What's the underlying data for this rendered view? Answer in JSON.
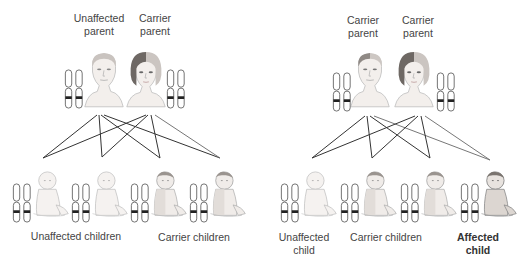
{
  "diagram": {
    "type": "autosomal recessive inheritance",
    "colors": {
      "line": "#333333",
      "outline": "#555555",
      "band": "#222222",
      "face": "#f1ece8",
      "shade": "#8a8a8a"
    }
  },
  "left_panel": {
    "parents": [
      {
        "label_line1": "Unaffected",
        "label_line2": "parent",
        "status": "unaffected"
      },
      {
        "label_line1": "Carrier",
        "label_line2": "parent",
        "status": "carrier"
      }
    ],
    "children_labels": [
      {
        "text": "Unaffected children"
      },
      {
        "text": "Carrier children"
      }
    ]
  },
  "right_panel": {
    "parents": [
      {
        "label_line1": "Carrier",
        "label_line2": "parent",
        "status": "carrier"
      },
      {
        "label_line1": "Carrier",
        "label_line2": "parent",
        "status": "carrier"
      }
    ],
    "children_labels": [
      {
        "line1": "Unaffected",
        "line2": "child"
      },
      {
        "text": "Carrier children"
      },
      {
        "line1": "Affected",
        "line2": "child"
      }
    ]
  }
}
